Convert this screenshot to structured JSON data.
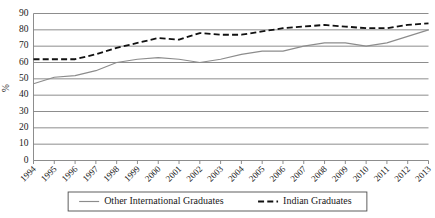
{
  "chart_data": {
    "type": "line",
    "title": "",
    "xlabel": "",
    "ylabel": "%",
    "ylim": [
      0,
      90
    ],
    "ytick_step": 10,
    "yticks": [
      0,
      10,
      20,
      30,
      40,
      50,
      60,
      70,
      80,
      90
    ],
    "grid": true,
    "legend_position": "bottom",
    "categories": [
      "1994",
      "1995",
      "1996",
      "1997",
      "1998",
      "1999",
      "2000",
      "2001",
      "2002",
      "2003",
      "2004",
      "2005",
      "2006",
      "2007",
      "2008",
      "2009",
      "2010",
      "2011",
      "2012",
      "2013"
    ],
    "series": [
      {
        "name": "Other International Graduates",
        "style": "solid",
        "color": "#8c8c8c",
        "values": [
          47,
          51,
          52,
          55,
          60,
          62,
          63,
          62,
          60,
          62,
          65,
          67,
          67,
          70,
          72,
          72,
          70,
          72,
          76,
          80
        ]
      },
      {
        "name": "Indian Graduates",
        "style": "dashed",
        "color": "#111111",
        "values": [
          62,
          62,
          62,
          65,
          69,
          72,
          75,
          74,
          78,
          77,
          77,
          79,
          81,
          82,
          83,
          82,
          81,
          81,
          83,
          84
        ]
      }
    ]
  },
  "legend": {
    "items": [
      {
        "label": "Other International Graduates",
        "style": "solid"
      },
      {
        "label": "Indian Graduates",
        "style": "dashed"
      }
    ]
  }
}
